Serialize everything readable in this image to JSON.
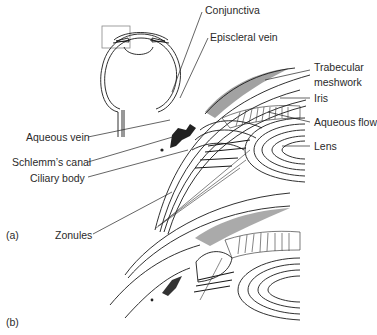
{
  "figure": {
    "panel_a_label": "(a)",
    "panel_b_label": "(b)",
    "labels": {
      "conjunctiva": "Conjunctiva",
      "episcleral_vein": "Episcleral vein",
      "trabecular_meshwork_line1": "Trabecular",
      "trabecular_meshwork_line2": "meshwork",
      "iris": "Iris",
      "aqueous_flow": "Aqueous flow",
      "lens": "Lens",
      "aqueous_vein": "Aqueous vein",
      "schlemms_canal": "Schlemm’s canal",
      "ciliary_body": "Ciliary body",
      "zonules": "Zonules"
    }
  }
}
